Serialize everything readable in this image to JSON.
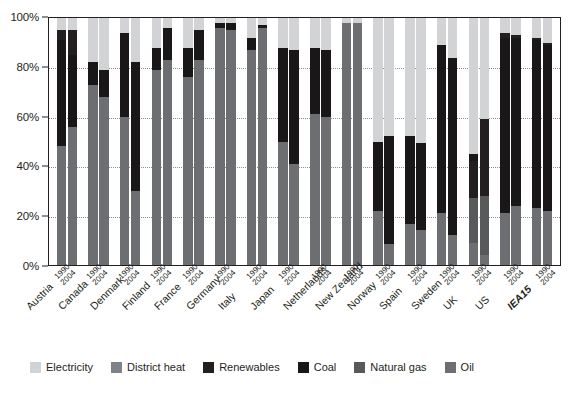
{
  "chart_data": {
    "type": "bar",
    "stacked": true,
    "title": "",
    "xlabel": "",
    "ylabel": "",
    "ylim": [
      0,
      100
    ],
    "ytick_labels": [
      "0%",
      "20%",
      "40%",
      "60%",
      "80%",
      "100%"
    ],
    "ytick_values": [
      0,
      20,
      40,
      60,
      80,
      100
    ],
    "grid": true,
    "grid_axis": "y",
    "legend_position": "bottom",
    "categories": [
      "Austria",
      "Canada",
      "Denmark",
      "Finland",
      "France",
      "Germany",
      "Italy",
      "Japan",
      "Netherlands",
      "New Zealand",
      "Norway",
      "Spain",
      "Sweden",
      "UK",
      "US",
      "IEA15"
    ],
    "sub_categories": [
      "1990",
      "2004"
    ],
    "series": [
      {
        "name": "Oil",
        "color": "#6d6e71",
        "values_1990": [
          48,
          56,
          61,
          50,
          40,
          52,
          62,
          60,
          61,
          11,
          15,
          21,
          9,
          21,
          23,
          24
        ],
        "values_2004": [
          56,
          34,
          68,
          30,
          39,
          60,
          60,
          55,
          74,
          7,
          10,
          12,
          4,
          24,
          24,
          22
        ]
      },
      {
        "name": "Natural gas",
        "color": "#58595b",
        "values_1990": [
          0,
          0,
          0,
          0,
          0,
          0,
          0,
          0,
          0,
          22,
          0,
          0,
          18,
          0,
          0,
          0
        ],
        "values_2004": [
          0,
          0,
          0,
          0,
          0,
          0,
          0,
          0,
          0,
          7,
          0,
          0,
          24,
          0,
          0,
          0
        ]
      },
      {
        "name": "Coal",
        "color": "#231f20",
        "values_1990": [
          43,
          29,
          21,
          44,
          9,
          30,
          24,
          0,
          0,
          17,
          35,
          68,
          3,
          71,
          68,
          68
        ],
        "values_2004": [
          29,
          51,
          11,
          52,
          13,
          35,
          27,
          0,
          0,
          33,
          32,
          72,
          0,
          68,
          68,
          67
        ]
      },
      {
        "name": "Renewables",
        "color": "#404041",
        "values_1990": [
          4,
          3,
          0,
          0,
          39,
          6,
          2,
          0,
          0,
          0,
          0,
          0,
          15,
          2,
          1,
          1
        ],
        "values_2004": [
          10,
          0,
          0,
          0,
          43,
          0,
          11,
          0,
          0,
          0,
          0,
          0,
          31,
          1,
          1,
          1
        ]
      },
      {
        "name": "District heat",
        "color": "#808285",
        "values_1990": [
          0,
          0,
          0,
          0,
          0,
          0,
          0,
          0,
          0,
          0,
          0,
          0,
          0,
          0,
          0,
          0
        ],
        "values_2004": [
          0,
          0,
          0,
          0,
          0,
          0,
          0,
          0,
          0,
          0,
          0,
          0,
          0,
          0,
          0,
          0
        ]
      },
      {
        "name": "Electricity",
        "color": "#d1d3d4",
        "values_1990": [
          5,
          12,
          18,
          6,
          12,
          12,
          12,
          40,
          39,
          50,
          50,
          11,
          55,
          6,
          8,
          7
        ],
        "values_2004": [
          5,
          15,
          21,
          18,
          5,
          5,
          2,
          45,
          26,
          53,
          58,
          16,
          41,
          7,
          7,
          10
        ]
      }
    ],
    "bars": [
      {
        "country": "Austria",
        "bold": false,
        "bars": [
          {
            "year": "1990",
            "segments": [
              {
                "name": "Oil",
                "value": 48
              },
              {
                "name": "Coal",
                "value": 43
              },
              {
                "name": "Renewables",
                "value": 4
              },
              {
                "name": "Electricity",
                "value": 5
              }
            ]
          },
          {
            "year": "2004",
            "segments": [
              {
                "name": "Oil",
                "value": 56
              },
              {
                "name": "Coal",
                "value": 29
              },
              {
                "name": "Renewables",
                "value": 10
              },
              {
                "name": "Electricity",
                "value": 5
              }
            ]
          }
        ]
      },
      {
        "country": "Canada",
        "bold": false,
        "bars": [
          {
            "year": "1990",
            "segments": [
              {
                "name": "Oil",
                "value": 73
              },
              {
                "name": "Coal",
                "value": 9
              },
              {
                "name": "Electricity",
                "value": 18
              }
            ]
          },
          {
            "year": "2004",
            "segments": [
              {
                "name": "Oil",
                "value": 68
              },
              {
                "name": "Coal",
                "value": 11
              },
              {
                "name": "Electricity",
                "value": 21
              }
            ]
          }
        ]
      },
      {
        "country": "Denmark",
        "bold": false,
        "bars": [
          {
            "year": "1990",
            "segments": [
              {
                "name": "Oil",
                "value": 60
              },
              {
                "name": "Coal",
                "value": 34
              },
              {
                "name": "Electricity",
                "value": 6
              }
            ]
          },
          {
            "year": "2004",
            "segments": [
              {
                "name": "Oil",
                "value": 30
              },
              {
                "name": "Coal",
                "value": 52
              },
              {
                "name": "Electricity",
                "value": 18
              }
            ]
          }
        ]
      },
      {
        "country": "Finland",
        "bold": false,
        "bars": [
          {
            "year": "1990",
            "segments": [
              {
                "name": "Oil",
                "value": 79
              },
              {
                "name": "Coal",
                "value": 9
              },
              {
                "name": "Electricity",
                "value": 12
              }
            ]
          },
          {
            "year": "2004",
            "segments": [
              {
                "name": "Oil",
                "value": 83
              },
              {
                "name": "Coal",
                "value": 13
              },
              {
                "name": "Electricity",
                "value": 4
              }
            ]
          }
        ]
      },
      {
        "country": "France",
        "bold": false,
        "bars": [
          {
            "year": "1990",
            "segments": [
              {
                "name": "Oil",
                "value": 76
              },
              {
                "name": "Coal",
                "value": 12
              },
              {
                "name": "Electricity",
                "value": 12
              }
            ]
          },
          {
            "year": "2004",
            "segments": [
              {
                "name": "Oil",
                "value": 83
              },
              {
                "name": "Coal",
                "value": 12
              },
              {
                "name": "Electricity",
                "value": 5
              }
            ]
          }
        ]
      },
      {
        "country": "Germany",
        "bold": false,
        "bars": [
          {
            "year": "1990",
            "segments": [
              {
                "name": "Oil",
                "value": 96
              },
              {
                "name": "Coal",
                "value": 2
              },
              {
                "name": "Electricity",
                "value": 2
              }
            ]
          },
          {
            "year": "2004",
            "segments": [
              {
                "name": "Oil",
                "value": 95
              },
              {
                "name": "Coal",
                "value": 3
              },
              {
                "name": "Electricity",
                "value": 2
              }
            ]
          }
        ]
      },
      {
        "country": "Italy",
        "bold": false,
        "bars": [
          {
            "year": "1990",
            "segments": [
              {
                "name": "Oil",
                "value": 87
              },
              {
                "name": "Coal",
                "value": 5
              },
              {
                "name": "Electricity",
                "value": 8
              }
            ]
          },
          {
            "year": "2004",
            "segments": [
              {
                "name": "Oil",
                "value": 96
              },
              {
                "name": "Coal",
                "value": 1
              },
              {
                "name": "Electricity",
                "value": 3
              }
            ]
          }
        ]
      },
      {
        "country": "Japan",
        "bold": false,
        "bars": [
          {
            "year": "1990",
            "segments": [
              {
                "name": "Oil",
                "value": 50
              },
              {
                "name": "Coal",
                "value": 38
              },
              {
                "name": "Electricity",
                "value": 12
              }
            ]
          },
          {
            "year": "2004",
            "segments": [
              {
                "name": "Oil",
                "value": 41
              },
              {
                "name": "Coal",
                "value": 46
              },
              {
                "name": "Electricity",
                "value": 13
              }
            ]
          }
        ]
      },
      {
        "country": "Netherlands",
        "bold": false,
        "bars": [
          {
            "year": "1990",
            "segments": [
              {
                "name": "Oil",
                "value": 61
              },
              {
                "name": "Coal",
                "value": 27
              },
              {
                "name": "Electricity",
                "value": 12
              }
            ]
          },
          {
            "year": "2004",
            "segments": [
              {
                "name": "Oil",
                "value": 60
              },
              {
                "name": "Coal",
                "value": 27
              },
              {
                "name": "Electricity",
                "value": 13
              }
            ]
          }
        ]
      },
      {
        "country": "New Zealand",
        "bold": false,
        "bars": [
          {
            "year": "1990",
            "segments": [
              {
                "name": "Oil",
                "value": 98
              },
              {
                "name": "Electricity",
                "value": 2
              }
            ]
          },
          {
            "year": "2004",
            "segments": [
              {
                "name": "Oil",
                "value": 98
              },
              {
                "name": "Electricity",
                "value": 2
              }
            ]
          }
        ]
      },
      {
        "country": "Norway",
        "bold": false,
        "bars": [
          {
            "year": "1990",
            "segments": [
              {
                "name": "Oil",
                "value": 22
              },
              {
                "name": "Coal",
                "value": 28
              },
              {
                "name": "Electricity",
                "value": 50
              }
            ]
          },
          {
            "year": "2004",
            "segments": [
              {
                "name": "Oil",
                "value": 7
              },
              {
                "name": "Coal",
                "value": 37
              },
              {
                "name": "Electricity",
                "value": 40
              }
            ]
          }
        ]
      },
      {
        "country": "Spain",
        "bold": false,
        "bars": [
          {
            "year": "1990",
            "segments": [
              {
                "name": "Oil",
                "value": 15
              },
              {
                "name": "Coal",
                "value": 32
              },
              {
                "name": "Electricity",
                "value": 43
              }
            ]
          },
          {
            "year": "2004",
            "segments": [
              {
                "name": "Oil",
                "value": 12
              },
              {
                "name": "Coal",
                "value": 30
              },
              {
                "name": "Electricity",
                "value": 43
              }
            ]
          }
        ]
      },
      {
        "country": "Sweden",
        "bold": false,
        "bars": [
          {
            "year": "1990",
            "segments": [
              {
                "name": "Oil",
                "value": 21
              },
              {
                "name": "Coal",
                "value": 68
              },
              {
                "name": "Electricity",
                "value": 11
              }
            ]
          },
          {
            "year": "2004",
            "segments": [
              {
                "name": "Oil",
                "value": 12
              },
              {
                "name": "Coal",
                "value": 72
              },
              {
                "name": "Electricity",
                "value": 16
              }
            ]
          }
        ]
      },
      {
        "country": "UK",
        "bold": false,
        "bars": [
          {
            "year": "1990",
            "segments": [
              {
                "name": "Oil",
                "value": 9
              },
              {
                "name": "Natural gas",
                "value": 18
              },
              {
                "name": "Renewables",
                "value": 15
              },
              {
                "name": "Coal",
                "value": 3
              },
              {
                "name": "Electricity",
                "value": 55
              }
            ]
          },
          {
            "year": "2004",
            "segments": [
              {
                "name": "Oil",
                "value": 4
              },
              {
                "name": "Natural gas",
                "value": 24
              },
              {
                "name": "Renewables",
                "value": 31
              },
              {
                "name": "Electricity",
                "value": 41
              }
            ]
          }
        ]
      },
      {
        "country": "US",
        "bold": false,
        "bars": [
          {
            "year": "1990",
            "segments": [
              {
                "name": "Oil",
                "value": 21
              },
              {
                "name": "Coal",
                "value": 71
              },
              {
                "name": "Renewables",
                "value": 2
              },
              {
                "name": "Electricity",
                "value": 6
              }
            ]
          },
          {
            "year": "2004",
            "segments": [
              {
                "name": "Oil",
                "value": 24
              },
              {
                "name": "Coal",
                "value": 68
              },
              {
                "name": "Renewables",
                "value": 1
              },
              {
                "name": "Electricity",
                "value": 7
              }
            ]
          }
        ]
      },
      {
        "country": "IEA15",
        "bold": true,
        "bars": [
          {
            "year": "1990",
            "segments": [
              {
                "name": "Oil",
                "value": 23
              },
              {
                "name": "Coal",
                "value": 68
              },
              {
                "name": "Renewables",
                "value": 1
              },
              {
                "name": "Electricity",
                "value": 8
              }
            ]
          },
          {
            "year": "2004",
            "segments": [
              {
                "name": "Oil",
                "value": 22
              },
              {
                "name": "Coal",
                "value": 67
              },
              {
                "name": "Renewables",
                "value": 1
              },
              {
                "name": "Electricity",
                "value": 10
              }
            ]
          }
        ]
      }
    ]
  },
  "legend": {
    "items": [
      {
        "label": "Electricity",
        "color": "#d1d3d4"
      },
      {
        "label": "District heat",
        "color": "#808285"
      },
      {
        "label": "Renewables",
        "color": "#231f20"
      },
      {
        "label": "Coal",
        "color": "#1a1718"
      },
      {
        "label": "Natural gas",
        "color": "#58595b"
      },
      {
        "label": "Oil",
        "color": "#6d6e71"
      }
    ]
  },
  "colors": {
    "electricity": "#d1d3d4",
    "district_heat": "#808285",
    "renewables": "#231f20",
    "coal": "#1a1718",
    "natural_gas": "#58595b",
    "oil": "#6d6e71",
    "axis": "#231f20",
    "grid": "#8d8d8d",
    "background": "#ffffff"
  },
  "axis": {
    "y_ticks": [
      "100%",
      "80%",
      "60%",
      "40%",
      "20%",
      "0%"
    ]
  }
}
